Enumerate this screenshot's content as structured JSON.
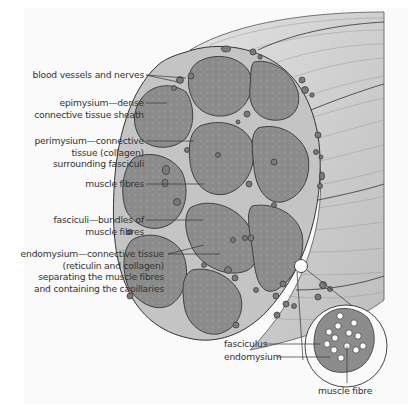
{
  "diagram": {
    "colors": {
      "background": "#fafafa",
      "fascicle_fill": "#8a8a8a",
      "connective_tissue": "#c6c6c6",
      "muscle_surface": "#d8d8d8",
      "vessel_fill": "#7a7a7a",
      "outline": "#3a3a3a",
      "text": "#333333"
    },
    "labels": [
      {
        "id": "blood-vessels",
        "lines": [
          "blood vessels and nerves"
        ]
      },
      {
        "id": "epimysium",
        "lines": [
          "epimysium—dense",
          "connective tissue sheath"
        ]
      },
      {
        "id": "perimysium",
        "lines": [
          "perimysium—connective",
          "tissue (collagen)",
          "surrounding fasciculi"
        ]
      },
      {
        "id": "muscle-fibres",
        "lines": [
          "muscle fibres"
        ]
      },
      {
        "id": "fasciculi",
        "lines": [
          "fasciculi—bundles of",
          "muscle fibres"
        ]
      },
      {
        "id": "endomysium",
        "lines": [
          "endomysium—connective tissue",
          "(reticulin and collagen)",
          "separating the muscle fibres",
          "and containing the capillaries"
        ]
      }
    ],
    "inset": {
      "labels": [
        {
          "id": "fasciculus",
          "text": "fasciculus"
        },
        {
          "id": "endomysium-inset",
          "text": "endomysium"
        },
        {
          "id": "muscle-fibre",
          "text": "muscle fibre"
        }
      ]
    }
  }
}
